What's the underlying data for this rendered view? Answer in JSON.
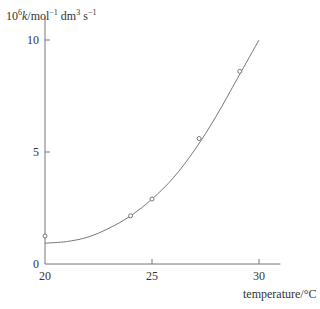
{
  "chart_data": {
    "type": "scatter",
    "title": "",
    "xlabel": "temperature/°C",
    "ylabel": "10⁶k/mol⁻¹ dm³ s⁻¹",
    "xlim": [
      20,
      31
    ],
    "ylim": [
      0,
      11
    ],
    "x_ticks": [
      20,
      25,
      30
    ],
    "y_ticks": [
      0,
      5,
      10
    ],
    "grid": false,
    "legend": null,
    "series": [
      {
        "name": "measured points",
        "style": "open-circle markers",
        "x": [
          20.0,
          24.0,
          25.0,
          27.2,
          29.1
        ],
        "y": [
          1.25,
          2.15,
          2.9,
          5.6,
          8.6
        ]
      },
      {
        "name": "fitted curve",
        "style": "smooth line",
        "x": [
          20.0,
          21.0,
          22.0,
          23.0,
          24.0,
          25.0,
          26.0,
          27.0,
          28.0,
          29.0,
          30.0
        ],
        "y": [
          0.93,
          1.0,
          1.2,
          1.6,
          2.15,
          2.9,
          3.85,
          5.1,
          6.6,
          8.3,
          10.0
        ]
      }
    ]
  }
}
